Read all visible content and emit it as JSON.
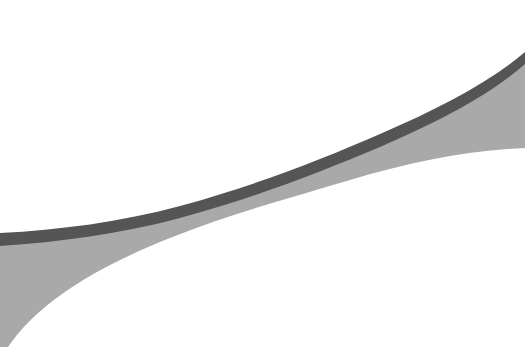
{
  "graphic": {
    "description": "Abstract curved ribbon shape",
    "colors": {
      "background": "#ffffff",
      "stroke_band": "#555555",
      "fill_shape": "#a9a9a9"
    }
  }
}
